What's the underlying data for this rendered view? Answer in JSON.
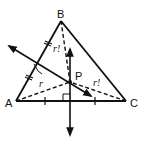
{
  "diagram": {
    "type": "geometry",
    "vertices": {
      "A": {
        "label": "A"
      },
      "B": {
        "label": "B"
      },
      "C": {
        "label": "C"
      },
      "P": {
        "label": "P"
      }
    },
    "segment_labels": {
      "PA": "r",
      "PB": "r!",
      "PC": "r!"
    },
    "colors": {
      "stroke": "#111111",
      "background": "#ffffff"
    }
  }
}
